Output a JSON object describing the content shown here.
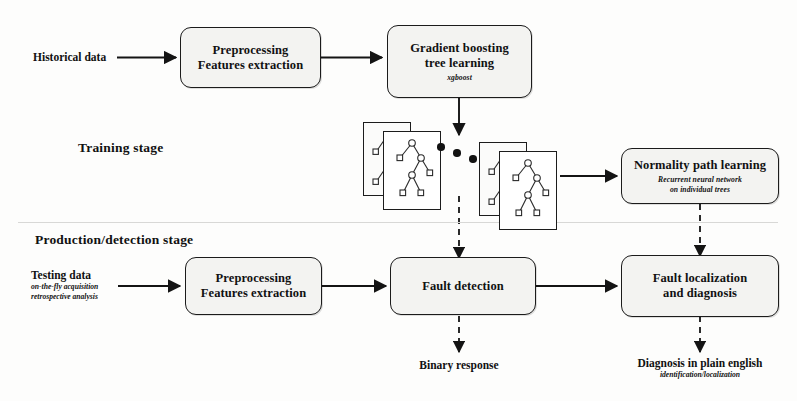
{
  "diagram": {
    "stages": {
      "training": "Training stage",
      "production": "Production/detection stage"
    },
    "inputs": {
      "historical": {
        "label": "Historical data"
      },
      "testing": {
        "label": "Testing data",
        "sub_line1": "on-the-fly acquisition",
        "sub_line2": "retrospective analysis"
      }
    },
    "boxes": {
      "preprocess_train": {
        "line1": "Preprocessing",
        "line2": "Features extraction"
      },
      "gradient_boosting": {
        "line1": "Gradient boosting",
        "line2": "tree learning",
        "sub": "xgboost"
      },
      "normality_path": {
        "line1": "Normality path learning",
        "sub_line1": "Recurrent neural network",
        "sub_line2": "on individual trees"
      },
      "preprocess_prod": {
        "line1": "Preprocessing",
        "line2": "Features extraction"
      },
      "fault_detection": {
        "line1": "Fault detection"
      },
      "fault_localization": {
        "line1": "Fault localization",
        "line2": "and diagnosis"
      }
    },
    "outputs": {
      "binary": {
        "label": "Binary response"
      },
      "diagnosis": {
        "label": "Diagnosis in plain english",
        "sub": "identification/localization"
      }
    },
    "tree_stacks": {
      "left": {
        "name": "first-trees",
        "cards": 2
      },
      "right": {
        "name": "last-trees",
        "cards": 2
      },
      "ellipsis": "• • •"
    },
    "colors": {
      "stroke": "#1b1b1b",
      "box_fill": "#f3f3f1",
      "card_fill": "#ffffff",
      "page": "#fdfdfc",
      "divider": "#d8d8d6"
    }
  }
}
